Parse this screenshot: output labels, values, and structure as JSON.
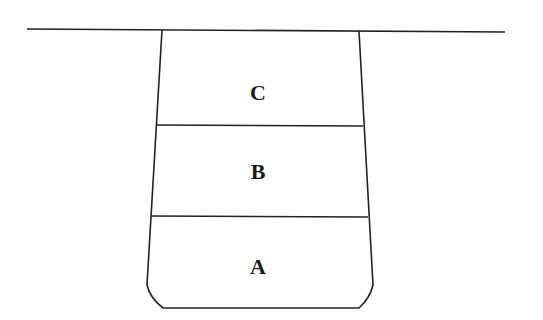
{
  "diagram": {
    "type": "layered-trench-cross-section",
    "ground_line": {
      "x1": 27,
      "y1": 29,
      "x2": 505,
      "y2": 32
    },
    "layers": [
      {
        "id": "C",
        "label": "C",
        "position": "top"
      },
      {
        "id": "B",
        "label": "B",
        "position": "middle"
      },
      {
        "id": "A",
        "label": "A",
        "position": "bottom"
      }
    ],
    "colors": {
      "line": "#222222",
      "text": "#1a1a1a",
      "background": "#ffffff"
    }
  }
}
